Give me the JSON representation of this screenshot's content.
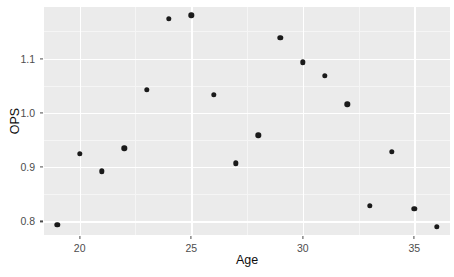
{
  "chart_data": {
    "type": "scatter",
    "title": "",
    "xlabel": "Age",
    "ylabel": "OPS",
    "xlim": [
      18.4,
      36.6
    ],
    "ylim": [
      0.775,
      1.195
    ],
    "grid": true,
    "legend": "none",
    "x_ticks": [
      20,
      25,
      30,
      35
    ],
    "x_tick_labels": [
      "20",
      "25",
      "30",
      "35"
    ],
    "x_minor_ticks": [
      22.5,
      27.5,
      32.5
    ],
    "y_ticks": [
      0.8,
      0.9,
      1.0,
      1.1
    ],
    "y_tick_labels": [
      "0.8",
      "0.9",
      "1.0",
      "1.1"
    ],
    "y_minor_ticks": [
      0.85,
      0.95,
      1.05,
      1.15
    ],
    "point_color": "#1a1a1a",
    "panel_background": "#ebebeb",
    "gridline_color": "#ffffff",
    "x": [
      19,
      20,
      21,
      22,
      23,
      24,
      25,
      26,
      27,
      28,
      29,
      30,
      31,
      32,
      33,
      34,
      35,
      36
    ],
    "y": [
      0.794,
      0.925,
      0.892,
      0.935,
      1.043,
      1.173,
      1.18,
      1.033,
      0.907,
      0.959,
      1.138,
      1.093,
      1.068,
      1.016,
      0.829,
      0.928,
      0.823,
      0.79
    ],
    "points": [
      {
        "x": 19,
        "y": 0.794
      },
      {
        "x": 20,
        "y": 0.925
      },
      {
        "x": 21,
        "y": 0.892
      },
      {
        "x": 22,
        "y": 0.935
      },
      {
        "x": 23,
        "y": 1.043
      },
      {
        "x": 24,
        "y": 1.173
      },
      {
        "x": 25,
        "y": 1.18
      },
      {
        "x": 26,
        "y": 1.033
      },
      {
        "x": 27,
        "y": 0.907
      },
      {
        "x": 28,
        "y": 0.959
      },
      {
        "x": 29,
        "y": 1.138
      },
      {
        "x": 30,
        "y": 1.093
      },
      {
        "x": 31,
        "y": 1.068
      },
      {
        "x": 32,
        "y": 1.016
      },
      {
        "x": 33,
        "y": 0.829
      },
      {
        "x": 34,
        "y": 0.928
      },
      {
        "x": 35,
        "y": 0.823
      },
      {
        "x": 36,
        "y": 0.79
      }
    ]
  }
}
